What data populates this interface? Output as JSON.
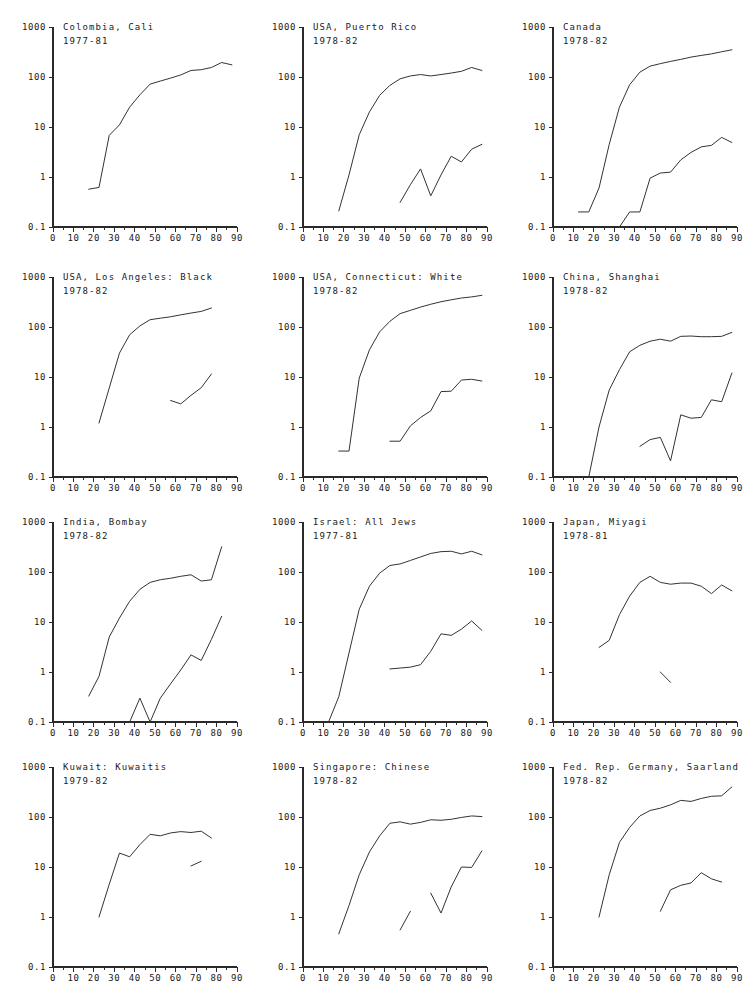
{
  "figure": {
    "name": "age-specific-incidence-panels",
    "layout": {
      "rows": 4,
      "cols": 3,
      "panel_width": 250,
      "panel_height": 250
    },
    "axis": {
      "x_ticks": [
        "0",
        "10",
        "20",
        "30",
        "40",
        "50",
        "60",
        "70",
        "80",
        "90"
      ],
      "x_tick_values": [
        0,
        10,
        20,
        30,
        40,
        50,
        60,
        70,
        80,
        90
      ],
      "x_minor_step": 5,
      "x_range": [
        0,
        90
      ],
      "y_ticks": [
        "1000",
        "100",
        "10",
        "1",
        "0.1"
      ],
      "y_tick_values": [
        1000,
        100,
        10,
        1,
        0.1
      ],
      "y_range": [
        0.1,
        1000
      ],
      "y_scale": "log",
      "xlabel": "",
      "ylabel": "",
      "grid": false
    },
    "line_color": "#333333",
    "axis_color": "#2a2a2a",
    "background": "#ffffff"
  },
  "chart_data": [
    {
      "type": "line",
      "title": "Colombia, Cali",
      "subtitle": "1977-81",
      "xlabel": "",
      "ylabel": "",
      "xlim": [
        0,
        90
      ],
      "ylim": [
        0.1,
        1000
      ],
      "yscale": "log",
      "grid": false,
      "series": [
        {
          "name": "series-1",
          "x": [
            17.5,
            22.5,
            27.5,
            32.5,
            37.5,
            42.5,
            47.5,
            52.5,
            57.5,
            62.5,
            67.5,
            72.5,
            77.5,
            82.5,
            87.5
          ],
          "y": [
            0.57,
            0.62,
            6.8,
            11,
            25,
            44,
            72,
            83,
            95,
            110,
            135,
            140,
            155,
            195,
            175
          ]
        }
      ]
    },
    {
      "type": "line",
      "title": "USA, Puerto Rico",
      "subtitle": "1978-82",
      "xlabel": "",
      "ylabel": "",
      "xlim": [
        0,
        90
      ],
      "ylim": [
        0.1,
        1000
      ],
      "yscale": "log",
      "grid": false,
      "series": [
        {
          "name": "series-1",
          "x": [
            17.5,
            22.5,
            27.5,
            32.5,
            37.5,
            42.5,
            47.5,
            52.5,
            57.5,
            62.5,
            67.5,
            72.5,
            77.5,
            82.5,
            87.5
          ],
          "y": [
            0.21,
            1.1,
            7.0,
            20,
            43,
            68,
            92,
            105,
            112,
            105,
            112,
            120,
            130,
            155,
            135
          ]
        },
        {
          "name": "series-2",
          "x": [
            47.5,
            52.5,
            57.5,
            62.5,
            67.5,
            72.5,
            77.5,
            82.5,
            87.5
          ],
          "y": [
            0.31,
            0.7,
            1.45,
            0.42,
            1.1,
            2.6,
            2.0,
            3.6,
            4.5
          ]
        }
      ]
    },
    {
      "type": "line",
      "title": "Canada",
      "subtitle": "1978-82",
      "xlabel": "",
      "ylabel": "",
      "xlim": [
        0,
        90
      ],
      "ylim": [
        0.1,
        1000
      ],
      "yscale": "log",
      "grid": false,
      "series": [
        {
          "name": "series-1",
          "x": [
            12.5,
            17.5,
            22.5,
            27.5,
            32.5,
            37.5,
            42.5,
            47.5,
            52.5,
            57.5,
            62.5,
            67.5,
            72.5,
            77.5,
            82.5,
            87.5
          ],
          "y": [
            0.2,
            0.2,
            0.6,
            4.5,
            25,
            70,
            125,
            165,
            185,
            205,
            225,
            250,
            270,
            290,
            320,
            350
          ]
        },
        {
          "name": "series-2",
          "x": [
            32.5,
            37.5,
            42.5,
            47.5,
            52.5,
            57.5,
            62.5,
            67.5,
            72.5,
            77.5,
            82.5,
            87.5
          ],
          "y": [
            0.1,
            0.2,
            0.2,
            0.95,
            1.2,
            1.25,
            2.2,
            3.1,
            4.0,
            4.3,
            6.2,
            4.9,
            8.5
          ]
        }
      ]
    },
    {
      "type": "line",
      "title": "USA, Los Angeles: Black",
      "subtitle": "1978-82",
      "xlabel": "",
      "ylabel": "",
      "xlim": [
        0,
        90
      ],
      "ylim": [
        0.1,
        1000
      ],
      "yscale": "log",
      "grid": false,
      "series": [
        {
          "name": "series-1",
          "x": [
            22.5,
            27.5,
            32.5,
            37.5,
            42.5,
            47.5,
            52.5,
            57.5,
            62.5,
            67.5,
            72.5,
            77.5
          ],
          "y": [
            1.2,
            6.0,
            30,
            70,
            105,
            140,
            150,
            160,
            175,
            190,
            205,
            240
          ]
        },
        {
          "name": "series-2",
          "x": [
            57.5,
            62.5,
            67.5,
            72.5,
            77.5
          ],
          "y": [
            3.4,
            2.9,
            4.3,
            6.1,
            11.5
          ]
        }
      ]
    },
    {
      "type": "line",
      "title": "USA, Connecticut: White",
      "subtitle": "1978-82",
      "xlabel": "",
      "ylabel": "",
      "xlim": [
        0,
        90
      ],
      "ylim": [
        0.1,
        1000
      ],
      "yscale": "log",
      "grid": false,
      "series": [
        {
          "name": "series-1",
          "x": [
            17.5,
            22.5,
            27.5,
            32.5,
            37.5,
            42.5,
            47.5,
            52.5,
            57.5,
            62.5,
            67.5,
            72.5,
            77.5,
            82.5,
            87.5
          ],
          "y": [
            0.33,
            0.33,
            9.5,
            35,
            80,
            130,
            185,
            215,
            250,
            285,
            320,
            350,
            380,
            400,
            430
          ]
        },
        {
          "name": "series-2",
          "x": [
            42.5,
            47.5,
            52.5,
            57.5,
            62.5,
            67.5,
            72.5,
            77.5,
            82.5,
            87.5
          ],
          "y": [
            0.52,
            0.52,
            1.05,
            1.55,
            2.1,
            5.1,
            5.2,
            8.7,
            9.0,
            8.3
          ]
        }
      ]
    },
    {
      "type": "line",
      "title": "China, Shanghai",
      "subtitle": "1978-82",
      "xlabel": "",
      "ylabel": "",
      "xlim": [
        0,
        90
      ],
      "ylim": [
        0.1,
        1000
      ],
      "yscale": "log",
      "grid": false,
      "series": [
        {
          "name": "series-1",
          "x": [
            17.5,
            22.5,
            27.5,
            32.5,
            37.5,
            42.5,
            47.5,
            52.5,
            57.5,
            62.5,
            67.5,
            72.5,
            77.5,
            82.5,
            87.5
          ],
          "y": [
            0.1,
            1.0,
            5.5,
            14,
            32,
            43,
            52,
            57,
            52,
            65,
            66,
            64,
            64,
            65,
            78
          ]
        },
        {
          "name": "series-2",
          "x": [
            42.5,
            47.5,
            52.5,
            57.5,
            62.5,
            67.5,
            72.5,
            77.5,
            82.5,
            87.5
          ],
          "y": [
            0.41,
            0.56,
            0.62,
            0.21,
            1.75,
            1.5,
            1.55,
            3.5,
            3.2,
            12.0
          ]
        }
      ]
    },
    {
      "type": "line",
      "title": "India, Bombay",
      "subtitle": "1978-82",
      "xlabel": "",
      "ylabel": "",
      "xlim": [
        0,
        90
      ],
      "ylim": [
        0.1,
        1000
      ],
      "yscale": "log",
      "grid": false,
      "series": [
        {
          "name": "series-1",
          "x": [
            17.5,
            22.5,
            27.5,
            32.5,
            37.5,
            42.5,
            47.5,
            52.5,
            57.5,
            62.5,
            67.5,
            72.5,
            77.5,
            82.5
          ],
          "y": [
            0.33,
            0.82,
            5.0,
            12,
            26,
            45,
            62,
            70,
            75,
            82,
            88,
            66,
            70,
            320
          ]
        },
        {
          "name": "series-2",
          "x": [
            37.5,
            42.5,
            47.5,
            52.5,
            57.5,
            62.5,
            67.5,
            72.5,
            77.5,
            82.5
          ],
          "y": [
            0.1,
            0.3,
            0.1,
            0.3,
            0.58,
            1.1,
            2.2,
            1.7,
            4.5,
            13.0
          ]
        }
      ]
    },
    {
      "type": "line",
      "title": "Israel: All Jews",
      "subtitle": "1977-81",
      "xlabel": "",
      "ylabel": "",
      "xlim": [
        0,
        90
      ],
      "ylim": [
        0.1,
        1000
      ],
      "yscale": "log",
      "grid": false,
      "series": [
        {
          "name": "series-1",
          "x": [
            12.5,
            17.5,
            22.5,
            27.5,
            32.5,
            37.5,
            42.5,
            47.5,
            52.5,
            57.5,
            62.5,
            67.5,
            72.5,
            77.5,
            82.5,
            87.5
          ],
          "y": [
            0.1,
            0.32,
            2.4,
            18,
            52,
            95,
            135,
            145,
            170,
            200,
            235,
            255,
            260,
            230,
            260,
            220
          ]
        },
        {
          "name": "series-2",
          "x": [
            42.5,
            47.5,
            52.5,
            57.5,
            62.5,
            67.5,
            72.5,
            77.5,
            82.5,
            87.5
          ],
          "y": [
            1.15,
            1.2,
            1.25,
            1.4,
            2.6,
            5.8,
            5.4,
            7.2,
            10.5,
            6.8
          ]
        }
      ]
    },
    {
      "type": "line",
      "title": "Japan, Miyagi",
      "subtitle": "1978-81",
      "xlabel": "",
      "ylabel": "",
      "xlim": [
        0,
        90
      ],
      "ylim": [
        0.1,
        1000
      ],
      "yscale": "log",
      "grid": false,
      "series": [
        {
          "name": "series-1",
          "x": [
            22.5,
            27.5,
            32.5,
            37.5,
            42.5,
            47.5,
            52.5,
            57.5,
            62.5,
            67.5,
            72.5,
            77.5,
            82.5,
            87.5
          ],
          "y": [
            3.1,
            4.3,
            14,
            33,
            62,
            82,
            62,
            57,
            60,
            60,
            52,
            37,
            55,
            42
          ]
        },
        {
          "name": "series-2",
          "x": [
            52.5,
            57.5
          ],
          "y": [
            1.0,
            0.62
          ]
        }
      ]
    },
    {
      "type": "line",
      "title": "Kuwait: Kuwaitis",
      "subtitle": "1979-82",
      "xlabel": "",
      "ylabel": "",
      "xlim": [
        0,
        90
      ],
      "ylim": [
        0.1,
        1000
      ],
      "yscale": "log",
      "grid": false,
      "series": [
        {
          "name": "series-1",
          "x": [
            22.5,
            27.5,
            32.5,
            37.5,
            42.5,
            47.5,
            52.5,
            57.5,
            62.5,
            67.5,
            72.5,
            77.5
          ],
          "y": [
            1.0,
            4.5,
            19,
            16,
            28,
            45,
            42,
            48,
            51,
            49,
            52,
            38,
            88
          ]
        },
        {
          "name": "series-2",
          "x": [
            67.5,
            72.5
          ],
          "y": [
            10.5,
            13.0
          ]
        }
      ]
    },
    {
      "type": "line",
      "title": "Singapore: Chinese",
      "subtitle": "1978-82",
      "xlabel": "",
      "ylabel": "",
      "xlim": [
        0,
        90
      ],
      "ylim": [
        0.1,
        1000
      ],
      "yscale": "log",
      "grid": false,
      "series": [
        {
          "name": "series-1",
          "x": [
            17.5,
            22.5,
            27.5,
            32.5,
            37.5,
            42.5,
            47.5,
            52.5,
            57.5,
            62.5,
            67.5,
            72.5,
            77.5,
            82.5,
            87.5
          ],
          "y": [
            0.46,
            1.7,
            7.0,
            20,
            42,
            75,
            80,
            72,
            78,
            88,
            86,
            90,
            98,
            105,
            102
          ]
        },
        {
          "name": "series-2",
          "x": [
            47.5,
            52.5
          ],
          "y": [
            0.55,
            1.3
          ]
        },
        {
          "name": "series-3",
          "x": [
            62.5,
            67.5,
            72.5,
            77.5,
            82.5,
            87.5
          ],
          "y": [
            3.0,
            1.2,
            4.0,
            10.0,
            9.8,
            21.0
          ]
        }
      ]
    },
    {
      "type": "line",
      "title": "Fed. Rep. Germany, Saarland",
      "subtitle": "1978-82",
      "xlabel": "",
      "ylabel": "",
      "xlim": [
        0,
        90
      ],
      "ylim": [
        0.1,
        1000
      ],
      "yscale": "log",
      "grid": false,
      "series": [
        {
          "name": "series-1",
          "x": [
            22.5,
            27.5,
            32.5,
            37.5,
            42.5,
            47.5,
            52.5,
            57.5,
            62.5,
            67.5,
            72.5,
            77.5,
            82.5,
            87.5
          ],
          "y": [
            1.0,
            7.0,
            31,
            62,
            105,
            135,
            150,
            175,
            215,
            205,
            235,
            260,
            265,
            400
          ]
        },
        {
          "name": "series-2",
          "x": [
            52.5,
            57.5,
            62.5,
            67.5,
            72.5,
            77.5,
            82.5
          ],
          "y": [
            1.3,
            3.5,
            4.3,
            4.8,
            7.7,
            5.8,
            5.0
          ]
        }
      ]
    }
  ]
}
